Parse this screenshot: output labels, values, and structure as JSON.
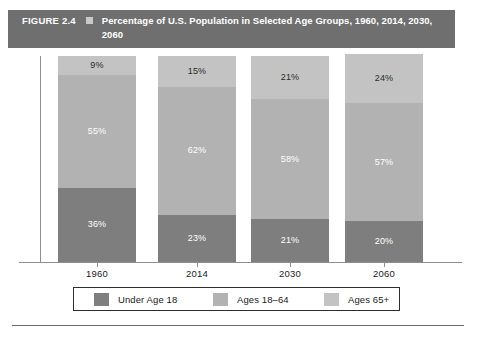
{
  "banner": {
    "figure_label": "FIGURE 2.4",
    "bullet_icon": "square-bullet-icon",
    "title": "Percentage of U.S. Population in Selected Age Groups, 1960, 2014, 2030, 2060",
    "background_color": "#6f6f6f",
    "text_color": "#ffffff"
  },
  "chart_data": {
    "type": "bar",
    "subtype": "stacked-bar-100",
    "title": "Percentage of U.S. Population in Selected Age Groups, 1960, 2014, 2030, 2060",
    "xlabel": "",
    "ylabel": "",
    "ylim": [
      0,
      100
    ],
    "grid": false,
    "legend_position": "bottom",
    "categories": [
      "1960",
      "2014",
      "2030",
      "2060"
    ],
    "series": [
      {
        "name": "Under Age 18",
        "color": "#7e7e7e",
        "label_color": "#ffffff",
        "values": [
          36,
          23,
          21,
          20
        ],
        "labels": [
          "36%",
          "23%",
          "21%",
          "20%"
        ]
      },
      {
        "name": "Ages 18–64",
        "color": "#b2b2b2",
        "label_color": "#ffffff",
        "values": [
          55,
          62,
          58,
          57
        ],
        "labels": [
          "55%",
          "62%",
          "58%",
          "57%"
        ]
      },
      {
        "name": "Ages 65+",
        "color": "#c3c3c3",
        "label_color": "#2b2b2b",
        "values": [
          9,
          15,
          21,
          24
        ],
        "labels": [
          "9%",
          "15%",
          "21%",
          "24%"
        ]
      }
    ]
  },
  "axis": {
    "tick_labels": [
      "1960",
      "2014",
      "2030",
      "2060"
    ],
    "line_color": "#8e8e8e"
  },
  "legend": {
    "items": [
      {
        "label": "Under Age 18",
        "color": "#7e7e7e"
      },
      {
        "label": "Ages 18–64",
        "color": "#b2b2b2"
      },
      {
        "label": "Ages 65+",
        "color": "#c3c3c3"
      }
    ]
  }
}
